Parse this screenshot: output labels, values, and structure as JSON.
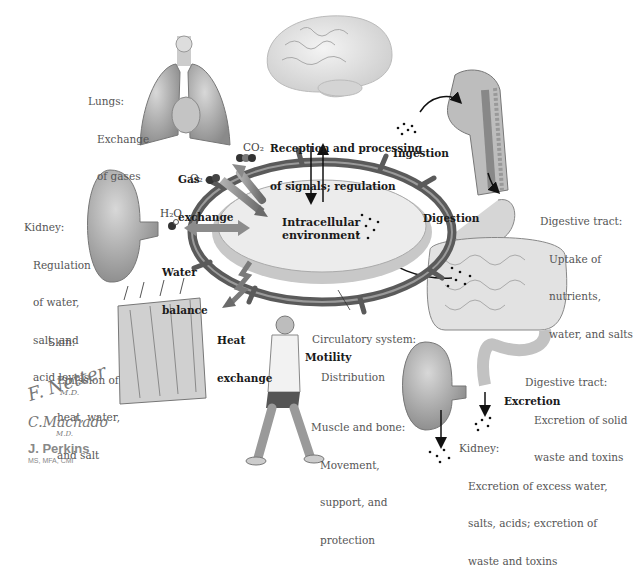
{
  "center": {
    "title_line1": "Intracellular",
    "title_line2": "environment"
  },
  "processes": {
    "signals_line1": "Reception and processing",
    "signals_line2": "of signals; regulation",
    "gas_line1": "Gas",
    "gas_line2": "exchange",
    "water_line1": "Water",
    "water_line2": "balance",
    "heat_line1": "Heat",
    "heat_line2": "exchange",
    "ingestion": "Ingestion",
    "digestion": "Digestion",
    "motility": "Motility",
    "excretion": "Excretion"
  },
  "chemicals": {
    "co2": "CO₂",
    "o2": "O₂",
    "h2o": "H₂O"
  },
  "organs": {
    "lungs": {
      "heading": "Lungs:",
      "body": [
        "Exchange",
        "of gases"
      ]
    },
    "kidney_regulation": {
      "heading": "Kidney:",
      "body": [
        "Regulation",
        "of water,",
        "salt, and",
        "acid levels"
      ]
    },
    "skin": {
      "heading": "Skin:",
      "body": [
        "Emission of",
        "heat, water,",
        "and salt"
      ]
    },
    "circulatory": {
      "heading": "Circulatory system:",
      "body": [
        "Distribution"
      ]
    },
    "muscle": {
      "heading": "Muscle and bone:",
      "body": [
        "Movement,",
        "support, and",
        "protection"
      ]
    },
    "digestive_uptake": {
      "heading": "Digestive tract:",
      "body": [
        "Uptake of",
        "nutrients,",
        "water, and salts"
      ]
    },
    "digestive_excretion": {
      "heading": "Digestive tract:",
      "body": [
        "Excretion of solid",
        "waste and toxins"
      ]
    },
    "kidney_excretion": {
      "heading": "Kidney:",
      "body": [
        "Excretion of excess water,",
        "salts, acids; excretion of",
        "waste and toxins"
      ]
    }
  },
  "credits": {
    "sig1": "F. Netter",
    "sig1_suffix": "M.D.",
    "sig2": "C.Machado",
    "sig2_suffix": "M.D.",
    "author": "J. Perkins",
    "author_credentials": "MS, MFA, CMI"
  },
  "icons": [
    "brain-illustration",
    "lungs-illustration",
    "head-neck-illustration",
    "kidney-illustration",
    "skin-illustration",
    "walking-man-illustration",
    "intestine-illustration",
    "cell-ellipse"
  ],
  "colors": {
    "vessel": "#5a5a5a",
    "vessel_light": "#8a8a8a",
    "dish": "#e8e8e8",
    "arrow_gray": "#8c8c8c",
    "text_bold": "#1a1a1a",
    "text_label": "#555555"
  }
}
